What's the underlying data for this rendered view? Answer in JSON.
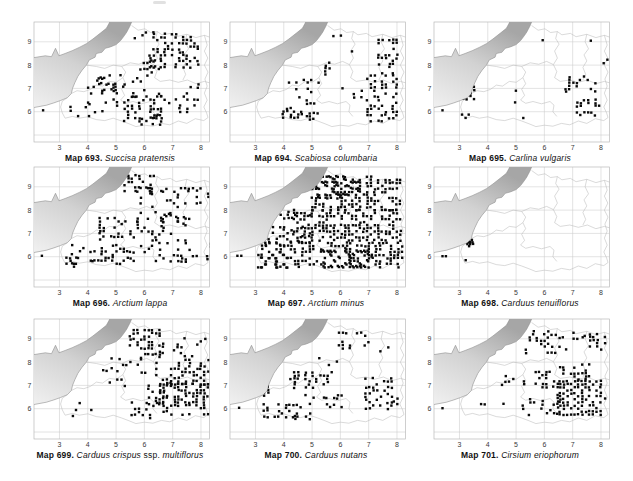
{
  "page": {
    "kind": "flora-atlas-plate",
    "maps_per_row": 3
  },
  "colors": {
    "dot": "#0a0a0a",
    "grid": "#cccccc",
    "frame": "#b9b9b9",
    "coast": "#8f8f8f",
    "boundary": "#b4b4b4",
    "sea_dark": "#a6a6a6",
    "sea_mid": "#d2d2d2",
    "sea_light": "#f0f0f0",
    "tick": "#3a3a3a",
    "caption": "#111111"
  },
  "axes": {
    "x_ticks": [
      "3",
      "4",
      "5",
      "6",
      "7",
      "8"
    ],
    "y_ticks": [
      "6",
      "7",
      "8",
      "9"
    ],
    "x_grid": [
      3,
      4,
      5,
      6,
      7,
      8
    ],
    "y_grid": [
      5,
      6,
      7,
      8,
      9
    ],
    "x_range": [
      2.1,
      8.3
    ],
    "y_range": [
      4.7,
      9.85
    ]
  },
  "base_map": {
    "coast": [
      [
        5.55,
        9.85
      ],
      [
        5.5,
        9.7
      ],
      [
        5.38,
        9.42
      ],
      [
        5.3,
        9.28
      ],
      [
        5.16,
        9.05
      ],
      [
        5.0,
        8.88
      ],
      [
        4.8,
        8.78
      ],
      [
        4.62,
        8.72
      ],
      [
        4.5,
        8.55
      ],
      [
        4.3,
        8.5
      ],
      [
        4.26,
        8.34
      ],
      [
        4.05,
        8.22
      ],
      [
        3.95,
        8.0
      ],
      [
        3.8,
        7.78
      ],
      [
        3.65,
        7.52
      ],
      [
        3.54,
        7.24
      ],
      [
        3.46,
        7.0
      ],
      [
        3.42,
        6.78
      ],
      [
        3.28,
        6.6
      ],
      [
        3.04,
        6.48
      ],
      [
        2.8,
        6.38
      ],
      [
        2.54,
        6.28
      ],
      [
        2.1,
        6.18
      ]
    ],
    "far_shore": [
      [
        2.1,
        8.32
      ],
      [
        2.5,
        8.4
      ],
      [
        2.72,
        8.36
      ],
      [
        2.86,
        8.72
      ],
      [
        2.98,
        8.4
      ],
      [
        3.2,
        8.5
      ],
      [
        3.45,
        8.62
      ],
      [
        3.7,
        8.76
      ],
      [
        3.95,
        8.92
      ],
      [
        4.18,
        9.12
      ],
      [
        4.45,
        9.38
      ],
      [
        4.66,
        9.58
      ],
      [
        4.78,
        9.85
      ]
    ],
    "boundaries": [
      [
        [
          5.55,
          9.7
        ],
        [
          5.78,
          9.5
        ],
        [
          6.02,
          9.56
        ],
        [
          6.22,
          9.4
        ],
        [
          6.46,
          9.44
        ],
        [
          6.62,
          9.3
        ],
        [
          6.92,
          9.36
        ],
        [
          7.12,
          9.22
        ],
        [
          7.5,
          9.32
        ],
        [
          7.82,
          9.18
        ],
        [
          8.12,
          9.28
        ],
        [
          8.3,
          9.2
        ]
      ],
      [
        [
          6.46,
          9.44
        ],
        [
          6.4,
          9.14
        ],
        [
          6.52,
          8.9
        ],
        [
          6.36,
          8.6
        ],
        [
          6.46,
          8.3
        ],
        [
          6.32,
          8.02
        ],
        [
          6.44,
          7.72
        ],
        [
          6.36,
          7.46
        ],
        [
          6.56,
          7.3
        ],
        [
          6.9,
          7.36
        ],
        [
          7.2,
          7.26
        ],
        [
          7.52,
          7.36
        ],
        [
          7.82,
          7.2
        ],
        [
          8.12,
          7.3
        ],
        [
          8.3,
          7.24
        ]
      ],
      [
        [
          3.28,
          6.6
        ],
        [
          3.1,
          6.45
        ],
        [
          3.04,
          6.2
        ],
        [
          3.1,
          5.95
        ],
        [
          3.2,
          5.72
        ],
        [
          3.46,
          5.8
        ],
        [
          3.7,
          5.72
        ],
        [
          4.0,
          5.78
        ],
        [
          4.3,
          5.66
        ],
        [
          4.6,
          5.62
        ],
        [
          4.9,
          5.72
        ],
        [
          5.2,
          5.6
        ],
        [
          5.46,
          5.48
        ],
        [
          5.7,
          5.36
        ],
        [
          6.0,
          5.42
        ],
        [
          6.3,
          5.38
        ],
        [
          6.6,
          5.5
        ],
        [
          6.9,
          5.44
        ],
        [
          7.2,
          5.6
        ],
        [
          7.5,
          5.5
        ],
        [
          7.8,
          5.7
        ],
        [
          8.1,
          5.62
        ],
        [
          8.25,
          5.75
        ],
        [
          8.2,
          5.95
        ],
        [
          8.1,
          6.2
        ],
        [
          8.22,
          6.5
        ],
        [
          8.12,
          6.8
        ],
        [
          8.22,
          7.1
        ],
        [
          8.14,
          7.4
        ],
        [
          8.25,
          7.7
        ],
        [
          8.12,
          8.0
        ],
        [
          8.24,
          8.3
        ],
        [
          8.12,
          8.6
        ],
        [
          8.22,
          8.86
        ],
        [
          8.12,
          9.28
        ]
      ],
      [
        [
          3.95,
          8.0
        ],
        [
          4.3,
          7.94
        ],
        [
          4.6,
          7.86
        ],
        [
          4.9,
          8.0
        ],
        [
          5.2,
          7.94
        ],
        [
          5.34,
          7.7
        ],
        [
          5.24,
          7.46
        ],
        [
          5.34,
          7.2
        ],
        [
          5.2,
          6.96
        ],
        [
          5.3,
          6.7
        ],
        [
          5.16,
          6.5
        ],
        [
          5.34,
          6.36
        ],
        [
          5.6,
          6.44
        ],
        [
          5.9,
          6.34
        ],
        [
          6.2,
          6.44
        ],
        [
          6.34,
          6.28
        ],
        [
          6.3,
          6.0
        ],
        [
          6.44,
          5.8
        ]
      ],
      [
        [
          3.42,
          6.78
        ],
        [
          3.62,
          6.9
        ],
        [
          3.86,
          6.86
        ],
        [
          4.1,
          6.96
        ],
        [
          4.3,
          7.14
        ],
        [
          4.52,
          7.1
        ],
        [
          4.76,
          7.3
        ],
        [
          5.0,
          7.26
        ],
        [
          5.24,
          7.46
        ]
      ],
      [
        [
          7.5,
          9.32
        ],
        [
          7.44,
          9.0
        ],
        [
          7.56,
          8.7
        ],
        [
          7.4,
          8.44
        ],
        [
          7.5,
          8.18
        ],
        [
          7.36,
          7.9
        ],
        [
          7.46,
          7.6
        ],
        [
          7.36,
          7.36
        ]
      ],
      [
        [
          5.2,
          7.94
        ],
        [
          5.5,
          8.1
        ],
        [
          5.8,
          8.04
        ],
        [
          6.08,
          8.16
        ],
        [
          6.32,
          8.02
        ]
      ]
    ]
  },
  "dot_grid_step": 0.13,
  "regions_format": "[x1,y1,x2,y2,density]",
  "maps": [
    {
      "number": "Map 693.",
      "species_parts": [
        {
          "t": "Succisa pratensis",
          "i": true
        }
      ],
      "regions": [
        [
          5.3,
          5.6,
          6.6,
          6.65,
          0.4
        ],
        [
          4.0,
          6.0,
          5.3,
          7.6,
          0.15
        ],
        [
          5.6,
          6.65,
          6.6,
          8.3,
          0.15
        ],
        [
          6.2,
          7.9,
          7.9,
          9.35,
          0.3
        ],
        [
          6.6,
          6.0,
          7.9,
          7.3,
          0.17
        ],
        [
          3.4,
          5.8,
          4.2,
          6.5,
          0.12
        ],
        [
          5.4,
          8.75,
          6.4,
          9.4,
          0.12
        ],
        [
          4.2,
          6.95,
          5.3,
          7.55,
          0.22
        ],
        [
          5.9,
          5.45,
          6.6,
          5.95,
          0.25
        ]
      ],
      "points": [
        [
          2.42,
          6.06
        ]
      ]
    },
    {
      "number": "Map 694.",
      "species_parts": [
        {
          "t": "Scabiosa columbaria",
          "i": true
        }
      ],
      "regions": [
        [
          6.95,
          5.6,
          8.1,
          7.65,
          0.32
        ],
        [
          7.35,
          7.65,
          8.1,
          9.2,
          0.28
        ],
        [
          3.85,
          5.75,
          4.75,
          6.15,
          0.45
        ],
        [
          3.25,
          6.2,
          3.75,
          6.6,
          0.18
        ],
        [
          4.2,
          6.85,
          5.35,
          7.4,
          0.18
        ],
        [
          4.55,
          6.35,
          5.65,
          6.7,
          0.2
        ],
        [
          5.35,
          7.6,
          5.85,
          8.15,
          0.25
        ],
        [
          5.5,
          8.6,
          7.0,
          9.3,
          0.07
        ],
        [
          5.7,
          6.1,
          6.8,
          7.5,
          0.05
        ],
        [
          4.8,
          5.55,
          5.6,
          5.95,
          0.12
        ]
      ],
      "points": []
    },
    {
      "number": "Map 695.",
      "species_parts": [
        {
          "t": "Carlina vulgaris",
          "i": true
        }
      ],
      "regions": [
        [
          3.0,
          6.55,
          3.55,
          7.3,
          0.3
        ],
        [
          2.95,
          5.75,
          3.6,
          6.1,
          0.3
        ],
        [
          4.35,
          5.75,
          5.35,
          6.0,
          0.18
        ],
        [
          4.85,
          6.4,
          5.3,
          6.95,
          0.3
        ],
        [
          6.75,
          6.85,
          7.85,
          7.5,
          0.18
        ],
        [
          7.15,
          5.85,
          7.95,
          6.5,
          0.28
        ],
        [
          5.95,
          8.8,
          7.7,
          9.15,
          0.1
        ],
        [
          7.85,
          8.1,
          8.25,
          8.45,
          0.35
        ],
        [
          4.05,
          7.25,
          4.6,
          7.6,
          0.15
        ],
        [
          5.55,
          6.6,
          6.0,
          6.9,
          0.1
        ]
      ],
      "points": [
        [
          2.4,
          6.06
        ]
      ]
    },
    {
      "number": "Map 696.",
      "species_parts": [
        {
          "t": "Arctium lappa",
          "i": true
        }
      ],
      "regions": [
        [
          3.45,
          5.7,
          5.5,
          6.6,
          0.25
        ],
        [
          4.3,
          6.6,
          5.45,
          7.8,
          0.22
        ],
        [
          5.5,
          5.8,
          7.45,
          7.5,
          0.25
        ],
        [
          5.75,
          7.5,
          7.6,
          9.0,
          0.25
        ],
        [
          5.3,
          8.7,
          6.6,
          9.5,
          0.3
        ],
        [
          7.45,
          5.9,
          8.45,
          6.6,
          0.22
        ],
        [
          7.6,
          8.3,
          8.5,
          9.0,
          0.18
        ],
        [
          3.25,
          5.55,
          4.3,
          5.95,
          0.18
        ],
        [
          6.6,
          7.3,
          7.6,
          7.9,
          0.2
        ]
      ],
      "points": [
        [
          2.38,
          6.04
        ]
      ]
    },
    {
      "number": "Map 697.",
      "species_parts": [
        {
          "t": "Arctium minus",
          "i": true
        }
      ],
      "regions": [
        [
          3.1,
          5.55,
          8.25,
          6.7,
          0.5
        ],
        [
          4.35,
          6.7,
          8.2,
          8.0,
          0.45
        ],
        [
          5.0,
          8.0,
          8.15,
          9.55,
          0.5
        ],
        [
          3.35,
          6.5,
          5.0,
          7.4,
          0.25
        ],
        [
          3.9,
          7.4,
          5.0,
          8.0,
          0.2
        ],
        [
          5.4,
          5.6,
          7.1,
          6.5,
          0.35
        ],
        [
          5.2,
          8.55,
          6.7,
          9.5,
          0.3
        ],
        [
          3.2,
          5.55,
          4.2,
          6.2,
          0.3
        ]
      ],
      "points": [
        [
          2.36,
          6.04
        ],
        [
          2.5,
          6.04
        ]
      ]
    },
    {
      "number": "Map 698.",
      "species_parts": [
        {
          "t": "Carduus tenuiflorus",
          "i": true
        }
      ],
      "regions": [],
      "points": [
        [
          2.4,
          6.02
        ],
        [
          2.52,
          6.02
        ],
        [
          3.3,
          6.62
        ],
        [
          3.38,
          6.64
        ],
        [
          3.46,
          6.62
        ],
        [
          3.28,
          6.54
        ],
        [
          3.38,
          6.54
        ],
        [
          3.48,
          6.55
        ],
        [
          3.44,
          6.72
        ],
        [
          3.34,
          6.45
        ],
        [
          3.22,
          5.85
        ]
      ]
    },
    {
      "number": "Map 699.",
      "species_parts": [
        {
          "t": "Carduus crispus",
          "i": true
        },
        {
          "t": " ssp. ",
          "i": false
        },
        {
          "t": "multiflorus",
          "i": true
        }
      ],
      "regions": [
        [
          6.55,
          5.75,
          8.25,
          7.05,
          0.55
        ],
        [
          6.95,
          7.05,
          8.25,
          8.1,
          0.45
        ],
        [
          6.15,
          6.2,
          6.95,
          7.3,
          0.3
        ],
        [
          5.55,
          5.6,
          6.55,
          6.35,
          0.25
        ],
        [
          5.5,
          8.2,
          6.65,
          9.4,
          0.35
        ],
        [
          6.65,
          8.25,
          7.75,
          9.1,
          0.22
        ],
        [
          4.4,
          6.85,
          5.6,
          7.75,
          0.12
        ],
        [
          3.2,
          5.7,
          4.4,
          6.4,
          0.08
        ],
        [
          4.85,
          7.75,
          5.9,
          8.2,
          0.15
        ],
        [
          7.75,
          8.35,
          8.25,
          9.0,
          0.15
        ],
        [
          5.9,
          7.3,
          6.6,
          8.2,
          0.15
        ]
      ],
      "points": []
    },
    {
      "number": "Map 700.",
      "species_parts": [
        {
          "t": "Carduus nutans",
          "i": true
        }
      ],
      "regions": [
        [
          5.95,
          8.6,
          7.1,
          9.25,
          0.35
        ],
        [
          4.25,
          6.9,
          5.7,
          7.65,
          0.35
        ],
        [
          3.3,
          5.65,
          4.65,
          6.25,
          0.4
        ],
        [
          6.9,
          6.0,
          7.9,
          7.3,
          0.35
        ],
        [
          3.05,
          6.55,
          3.5,
          7.0,
          0.4
        ],
        [
          5.25,
          6.05,
          6.05,
          6.6,
          0.15
        ],
        [
          4.65,
          6.2,
          5.6,
          6.6,
          0.12
        ],
        [
          7.3,
          8.35,
          8.05,
          8.8,
          0.1
        ],
        [
          5.6,
          7.75,
          6.25,
          8.3,
          0.1
        ],
        [
          4.4,
          5.55,
          5.3,
          5.9,
          0.18
        ],
        [
          7.9,
          5.8,
          8.25,
          6.45,
          0.25
        ],
        [
          5.0,
          7.9,
          5.6,
          8.3,
          0.08
        ]
      ],
      "points": [
        [
          2.42,
          6.04
        ]
      ]
    },
    {
      "number": "Map 701.",
      "species_parts": [
        {
          "t": "Cirsium eriophorum",
          "i": true
        }
      ],
      "regions": [
        [
          6.55,
          5.75,
          8.1,
          7.25,
          0.55
        ],
        [
          5.95,
          5.8,
          6.55,
          6.6,
          0.32
        ],
        [
          5.25,
          6.0,
          5.95,
          6.5,
          0.25
        ],
        [
          5.55,
          6.8,
          6.55,
          7.6,
          0.25
        ],
        [
          6.55,
          7.25,
          7.6,
          8.0,
          0.3
        ],
        [
          5.35,
          8.4,
          6.85,
          9.4,
          0.18
        ],
        [
          7.35,
          8.55,
          8.2,
          9.2,
          0.35
        ],
        [
          4.5,
          6.9,
          5.5,
          7.5,
          0.12
        ],
        [
          3.5,
          5.8,
          4.55,
          6.3,
          0.12
        ],
        [
          6.9,
          9.0,
          7.6,
          9.5,
          0.2
        ],
        [
          4.95,
          5.6,
          5.9,
          5.92,
          0.15
        ],
        [
          8.0,
          6.3,
          8.25,
          7.1,
          0.25
        ]
      ],
      "points": [
        [
          2.4,
          6.02
        ]
      ]
    }
  ]
}
